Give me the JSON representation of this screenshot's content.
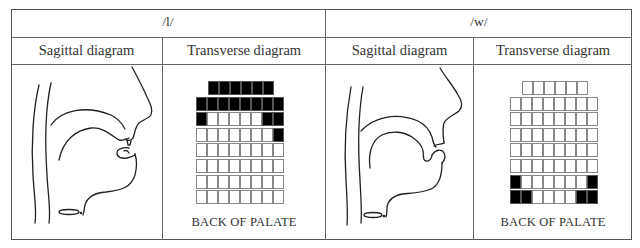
{
  "table": {
    "sounds": [
      {
        "symbol": "/l/",
        "sagittal_label": "Sagittal diagram",
        "transverse_label": "Transverse diagram",
        "caption": "BACK OF PALATE",
        "palate_rows": [
          [
            1,
            1,
            1,
            1,
            1,
            1
          ],
          [
            1,
            1,
            1,
            1,
            1,
            1,
            1,
            1
          ],
          [
            1,
            0,
            0,
            0,
            0,
            0,
            1,
            1
          ],
          [
            0,
            0,
            0,
            0,
            0,
            0,
            0,
            1
          ],
          [
            0,
            0,
            0,
            0,
            0,
            0,
            0,
            0
          ],
          [
            0,
            0,
            0,
            0,
            0,
            0,
            0,
            0
          ],
          [
            0,
            0,
            0,
            0,
            0,
            0,
            0,
            0
          ],
          [
            0,
            0,
            0,
            0,
            0,
            0,
            0,
            0
          ]
        ]
      },
      {
        "symbol": "/w/",
        "sagittal_label": "Sagittal diagram",
        "transverse_label": "Transverse diagram",
        "caption": "BACK OF PALATE",
        "palate_rows": [
          [
            0,
            0,
            0,
            0,
            0,
            0
          ],
          [
            0,
            0,
            0,
            0,
            0,
            0,
            0,
            0
          ],
          [
            0,
            0,
            0,
            0,
            0,
            0,
            0,
            0
          ],
          [
            0,
            0,
            0,
            0,
            0,
            0,
            0,
            0
          ],
          [
            0,
            0,
            0,
            0,
            0,
            0,
            0,
            0
          ],
          [
            0,
            0,
            0,
            0,
            0,
            0,
            0,
            0
          ],
          [
            1,
            0,
            0,
            0,
            0,
            0,
            0,
            1
          ],
          [
            1,
            1,
            0,
            0,
            0,
            0,
            1,
            1
          ]
        ]
      }
    ]
  },
  "colors": {
    "contact": "#000000",
    "no_contact": "#ffffff",
    "grid_line": "#888888",
    "border": "#555555"
  }
}
